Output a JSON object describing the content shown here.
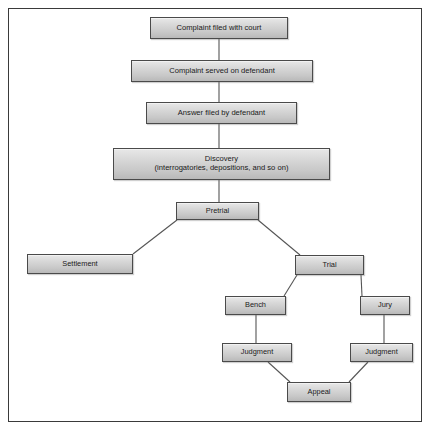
{
  "diagram": {
    "type": "flowchart",
    "nodes": [
      {
        "id": "complaint_filed",
        "label": "Complaint filed with court",
        "x": 150,
        "y": 17,
        "w": 138,
        "h": 22
      },
      {
        "id": "complaint_served",
        "label": "Complaint served on defendant",
        "x": 131,
        "y": 60,
        "w": 182,
        "h": 22
      },
      {
        "id": "answer_filed",
        "label": "Answer filed by defendant",
        "x": 146,
        "y": 102,
        "w": 151,
        "h": 22
      },
      {
        "id": "discovery_line1",
        "label": "Discovery",
        "label2": "(interrogatories, depositions, and so on)",
        "x": 113,
        "y": 148,
        "w": 217,
        "h": 32
      },
      {
        "id": "pretrial",
        "label": "Pretrial",
        "x": 176,
        "y": 202,
        "w": 83,
        "h": 18
      },
      {
        "id": "settlement",
        "label": "Settlement",
        "x": 27,
        "y": 254,
        "w": 106,
        "h": 20
      },
      {
        "id": "trial",
        "label": "Trial",
        "x": 295,
        "y": 255,
        "w": 69,
        "h": 20
      },
      {
        "id": "bench",
        "label": "Bench",
        "x": 225,
        "y": 296,
        "w": 61,
        "h": 19
      },
      {
        "id": "jury",
        "label": "Jury",
        "x": 360,
        "y": 296,
        "w": 50,
        "h": 19
      },
      {
        "id": "judgment_bench",
        "label": "Judgment",
        "x": 222,
        "y": 343,
        "w": 70,
        "h": 19
      },
      {
        "id": "judgment_jury",
        "label": "Judgment",
        "x": 350,
        "y": 343,
        "w": 63,
        "h": 19
      },
      {
        "id": "appeal",
        "label": "Appeal",
        "x": 287,
        "y": 382,
        "w": 64,
        "h": 20
      }
    ],
    "edges": [
      {
        "from": "complaint_filed",
        "to": "complaint_served",
        "kind": "vertical"
      },
      {
        "from": "complaint_served",
        "to": "answer_filed",
        "kind": "vertical"
      },
      {
        "from": "answer_filed",
        "to": "discovery",
        "kind": "vertical"
      },
      {
        "from": "discovery",
        "to": "pretrial",
        "kind": "vertical"
      },
      {
        "from": "pretrial",
        "to": "settlement",
        "kind": "diagonal"
      },
      {
        "from": "pretrial",
        "to": "trial",
        "kind": "diagonal"
      },
      {
        "from": "trial",
        "to": "bench",
        "kind": "diagonal"
      },
      {
        "from": "trial",
        "to": "jury",
        "kind": "diagonal"
      },
      {
        "from": "bench",
        "to": "judgment_bench",
        "kind": "vertical"
      },
      {
        "from": "jury",
        "to": "judgment_jury",
        "kind": "vertical"
      },
      {
        "from": "judgment_bench",
        "to": "appeal",
        "kind": "diagonal"
      },
      {
        "from": "judgment_jury",
        "to": "appeal",
        "kind": "diagonal"
      }
    ]
  },
  "colors": {
    "box_fill_top": "#e8e8e8",
    "box_fill_bottom": "#b9b9b9",
    "box_border": "#4a4a4a",
    "line": "#555555",
    "frame_border": "#3a3a3a",
    "background": "#ffffff",
    "text": "#1a1a1a"
  }
}
